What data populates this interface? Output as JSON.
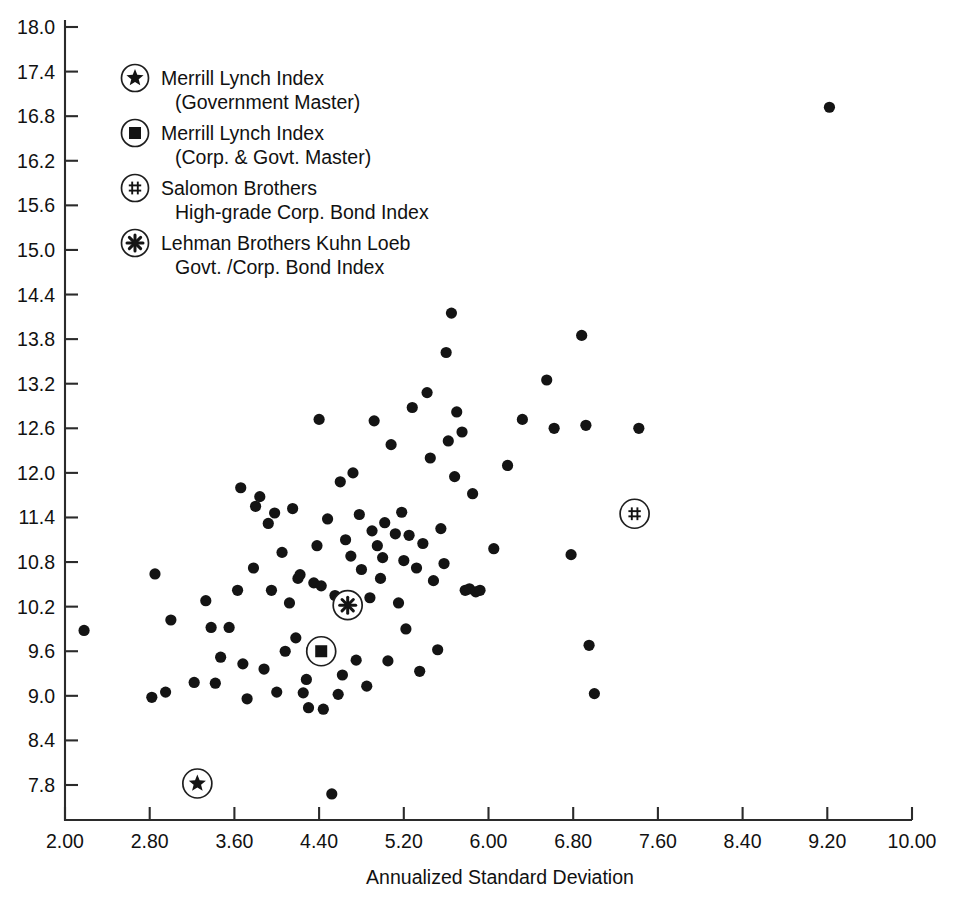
{
  "chart_data": {
    "type": "scatter",
    "title": "",
    "xlabel": "Annualized Standard Deviation",
    "ylabel": "",
    "xlim": [
      2.0,
      10.0
    ],
    "ylim": [
      7.5,
      18.0
    ],
    "grid": false,
    "legend_position": "upper-left-inside",
    "x_ticks": [
      "2.00",
      "2.80",
      "3.60",
      "4.40",
      "5.20",
      "6.00",
      "6.80",
      "7.60",
      "8.40",
      "9.20",
      "10.00"
    ],
    "x_tick_values": [
      2.0,
      2.8,
      3.6,
      4.4,
      5.2,
      6.0,
      6.8,
      7.6,
      8.4,
      9.2,
      10.0
    ],
    "y_ticks": [
      "18.0",
      "17.4",
      "16.8",
      "16.2",
      "15.6",
      "15.0",
      "14.4",
      "13.8",
      "13.2",
      "12.6",
      "12.0",
      "11.4",
      "10.8",
      "10.2",
      "9.6",
      "9.0",
      "8.4",
      "7.8"
    ],
    "y_tick_values": [
      18.0,
      17.4,
      16.8,
      16.2,
      15.6,
      15.0,
      14.4,
      13.8,
      13.2,
      12.6,
      12.0,
      11.4,
      10.8,
      10.2,
      9.6,
      9.0,
      8.4,
      7.8
    ],
    "series": [
      {
        "name": "Managers",
        "marker": "filled-circle",
        "color": "#141414",
        "points": [
          [
            2.18,
            9.88
          ],
          [
            2.82,
            8.98
          ],
          [
            2.85,
            10.64
          ],
          [
            2.95,
            9.05
          ],
          [
            3.0,
            10.02
          ],
          [
            3.22,
            9.18
          ],
          [
            3.33,
            10.28
          ],
          [
            3.38,
            9.92
          ],
          [
            3.42,
            9.17
          ],
          [
            3.47,
            9.52
          ],
          [
            3.55,
            9.92
          ],
          [
            3.63,
            10.42
          ],
          [
            3.66,
            11.8
          ],
          [
            3.68,
            9.43
          ],
          [
            3.72,
            8.96
          ],
          [
            3.78,
            10.72
          ],
          [
            3.8,
            11.55
          ],
          [
            3.84,
            11.68
          ],
          [
            3.88,
            9.36
          ],
          [
            3.92,
            11.32
          ],
          [
            3.95,
            10.42
          ],
          [
            3.98,
            11.46
          ],
          [
            4.0,
            9.05
          ],
          [
            4.05,
            10.93
          ],
          [
            4.08,
            9.6
          ],
          [
            4.12,
            10.25
          ],
          [
            4.15,
            11.52
          ],
          [
            4.18,
            9.78
          ],
          [
            4.2,
            10.58
          ],
          [
            4.22,
            10.63
          ],
          [
            4.25,
            9.04
          ],
          [
            4.28,
            9.22
          ],
          [
            4.3,
            8.84
          ],
          [
            4.33,
            9.62
          ],
          [
            4.35,
            10.52
          ],
          [
            4.38,
            11.02
          ],
          [
            4.4,
            12.72
          ],
          [
            4.42,
            10.48
          ],
          [
            4.44,
            8.82
          ],
          [
            4.46,
            9.58
          ],
          [
            4.48,
            11.38
          ],
          [
            4.52,
            7.68
          ],
          [
            4.55,
            10.35
          ],
          [
            4.58,
            9.02
          ],
          [
            4.6,
            11.88
          ],
          [
            4.62,
            9.28
          ],
          [
            4.65,
            11.1
          ],
          [
            4.68,
            10.12
          ],
          [
            4.7,
            10.88
          ],
          [
            4.72,
            12.0
          ],
          [
            4.75,
            9.48
          ],
          [
            4.78,
            11.44
          ],
          [
            4.8,
            10.7
          ],
          [
            4.85,
            9.13
          ],
          [
            4.88,
            10.32
          ],
          [
            4.9,
            11.22
          ],
          [
            4.92,
            12.7
          ],
          [
            4.95,
            11.02
          ],
          [
            4.98,
            10.58
          ],
          [
            5.0,
            10.86
          ],
          [
            5.02,
            11.33
          ],
          [
            5.05,
            9.47
          ],
          [
            5.08,
            12.38
          ],
          [
            5.12,
            11.18
          ],
          [
            5.15,
            10.25
          ],
          [
            5.18,
            11.47
          ],
          [
            5.2,
            10.82
          ],
          [
            5.22,
            9.9
          ],
          [
            5.25,
            11.16
          ],
          [
            5.28,
            12.88
          ],
          [
            5.32,
            10.72
          ],
          [
            5.35,
            9.33
          ],
          [
            5.38,
            11.05
          ],
          [
            5.42,
            13.08
          ],
          [
            5.45,
            12.2
          ],
          [
            5.48,
            10.55
          ],
          [
            5.52,
            9.62
          ],
          [
            5.55,
            11.25
          ],
          [
            5.58,
            10.78
          ],
          [
            5.6,
            13.62
          ],
          [
            5.62,
            12.43
          ],
          [
            5.65,
            14.15
          ],
          [
            5.68,
            11.95
          ],
          [
            5.7,
            12.82
          ],
          [
            5.75,
            12.55
          ],
          [
            5.78,
            10.42
          ],
          [
            5.82,
            10.44
          ],
          [
            5.85,
            11.72
          ],
          [
            5.88,
            10.4
          ],
          [
            5.92,
            10.42
          ],
          [
            6.05,
            10.98
          ],
          [
            6.18,
            12.1
          ],
          [
            6.32,
            12.72
          ],
          [
            6.55,
            13.25
          ],
          [
            6.62,
            12.6
          ],
          [
            6.78,
            10.9
          ],
          [
            6.88,
            13.85
          ],
          [
            6.92,
            12.64
          ],
          [
            6.95,
            9.68
          ],
          [
            7.0,
            9.03
          ],
          [
            7.42,
            12.6
          ],
          [
            9.22,
            16.92
          ]
        ]
      }
    ],
    "highlighted_markers": [
      {
        "label": "Merrill Lynch Index (Government Master)",
        "marker": "star",
        "x": 3.25,
        "y": 7.82
      },
      {
        "label": "Merrill Lynch Index (Corp. & Govt. Master)",
        "marker": "square",
        "x": 4.42,
        "y": 9.6
      },
      {
        "label": "Salomon Brothers High-grade Corp. Bond Index",
        "marker": "double-dagger",
        "x": 7.38,
        "y": 11.45
      },
      {
        "label": "Lehman Brothers Kuhn Loeb Govt./Corp. Bond Index",
        "marker": "asterisk",
        "x": 4.67,
        "y": 10.22
      }
    ],
    "legend": [
      {
        "marker": "star",
        "line1": "Merrill Lynch Index",
        "line2": "(Government Master)"
      },
      {
        "marker": "square",
        "line1": "Merrill Lynch Index",
        "line2": "(Corp. & Govt. Master)"
      },
      {
        "marker": "double-dagger",
        "line1": "Salomon Brothers",
        "line2": "High-grade Corp. Bond Index"
      },
      {
        "marker": "asterisk",
        "line1": "Lehman Brothers Kuhn Loeb",
        "line2": "Govt. /Corp. Bond Index"
      }
    ]
  },
  "colors": {
    "point": "#141414",
    "axis": "#2b2b2b",
    "background": "#ffffff"
  }
}
